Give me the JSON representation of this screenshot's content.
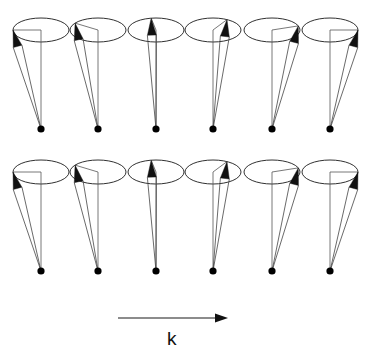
{
  "figure": {
    "title": "",
    "background": "#ffffff",
    "ink_color": "#111111",
    "line_color": "#555555",
    "wave_label": "k"
  },
  "geometry": {
    "ellipse_rx": 28,
    "ellipse_ry": 12,
    "dot_radius": 3.6,
    "arrow_head_len": 17,
    "arrow_head_width": 9
  },
  "chart_data": {
    "type": "scatter",
    "title": "",
    "xlabel": "k",
    "ylabel": "",
    "rows": [
      {
        "row_index": 0,
        "center_y": 30,
        "origin_y": 129,
        "spins": [
          {
            "index": 0,
            "cx": 41,
            "phase_deg": 180,
            "tip_x": 13,
            "tip_y": 30
          },
          {
            "index": 1,
            "cx": 98,
            "phase_deg": 215,
            "tip_x": 75,
            "tip_y": 23
          },
          {
            "index": 2,
            "cx": 156,
            "phase_deg": 260,
            "tip_x": 151,
            "tip_y": 18
          },
          {
            "index": 3,
            "cx": 213,
            "phase_deg": 300,
            "tip_x": 227,
            "tip_y": 20
          },
          {
            "index": 4,
            "cx": 272,
            "phase_deg": 340,
            "tip_x": 298,
            "tip_y": 26
          },
          {
            "index": 5,
            "cx": 330,
            "phase_deg": 0,
            "tip_x": 358,
            "tip_y": 30
          }
        ]
      },
      {
        "row_index": 1,
        "center_y": 172,
        "origin_y": 271,
        "spins": [
          {
            "index": 0,
            "cx": 41,
            "phase_deg": 180,
            "tip_x": 13,
            "tip_y": 172
          },
          {
            "index": 1,
            "cx": 98,
            "phase_deg": 215,
            "tip_x": 75,
            "tip_y": 165
          },
          {
            "index": 2,
            "cx": 156,
            "phase_deg": 260,
            "tip_x": 151,
            "tip_y": 160
          },
          {
            "index": 3,
            "cx": 213,
            "phase_deg": 300,
            "tip_x": 227,
            "tip_y": 162
          },
          {
            "index": 4,
            "cx": 272,
            "phase_deg": 340,
            "tip_x": 298,
            "tip_y": 168
          },
          {
            "index": 5,
            "cx": 330,
            "phase_deg": 0,
            "tip_x": 358,
            "tip_y": 172
          }
        ]
      }
    ],
    "k_axis": {
      "label": "k",
      "x_start": 118,
      "x_end": 228,
      "y": 318,
      "label_x": 172,
      "label_y": 347
    }
  }
}
